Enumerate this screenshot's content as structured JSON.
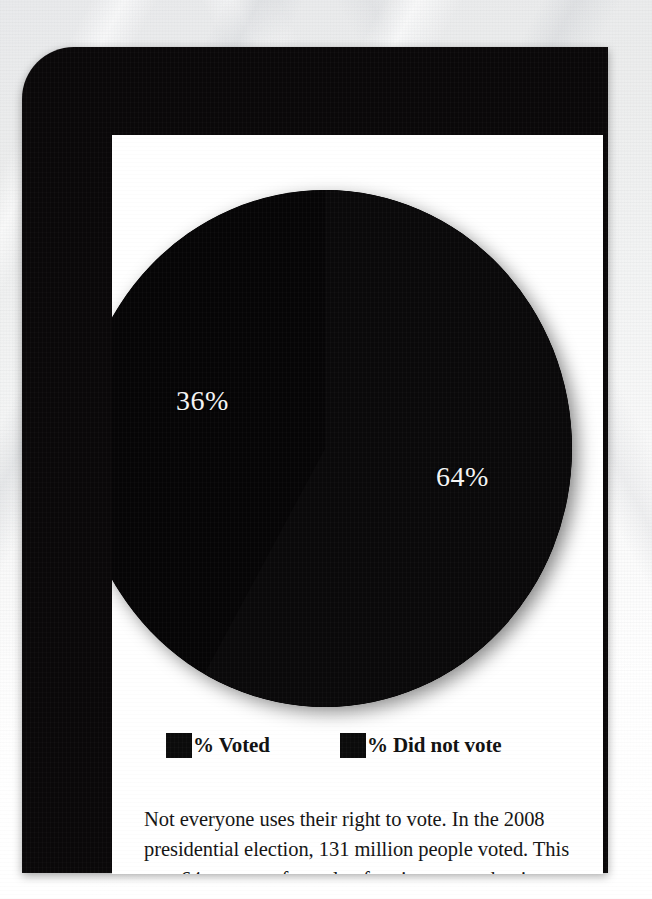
{
  "poster": {
    "frame_color": "#0a0809",
    "panel_color": "#ffffff",
    "background_description": "light gray textured paper with diagonal streaks"
  },
  "chart_data": {
    "type": "pie",
    "title": "",
    "categories": [
      "% Voted",
      "% Did not vote"
    ],
    "values": [
      64,
      36
    ],
    "value_labels": [
      "64%",
      "36%"
    ],
    "colors": [
      "#060506",
      "#0a090a"
    ],
    "legend_position": "bottom",
    "grid": false,
    "labels_on_slices": true,
    "slice_label_left": "36%",
    "slice_label_right": "64%"
  },
  "legend": {
    "items": [
      {
        "label": "% Voted",
        "swatch_color": "#0b0b0b"
      },
      {
        "label": "% Did not vote",
        "swatch_color": "#0b0b0b"
      }
    ]
  },
  "caption": {
    "text": "Not everyone uses their right to vote. In the 2008 presidential election, 131 million people voted. This was 64 percent of people of voting age at the time."
  }
}
